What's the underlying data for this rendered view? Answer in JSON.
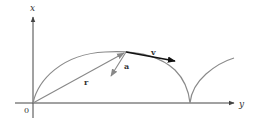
{
  "diagram": {
    "axes": {
      "vertical_label": "x",
      "horizontal_label": "y",
      "origin_label": "0"
    },
    "vectors": {
      "position": {
        "label": "r",
        "color": "#888888"
      },
      "velocity": {
        "label": "v",
        "color": "#111111"
      },
      "acceleration": {
        "label": "a",
        "color": "#888888"
      }
    },
    "colors": {
      "axis": "#444444",
      "curve": "#8a8a8a",
      "label": "#333333"
    }
  }
}
